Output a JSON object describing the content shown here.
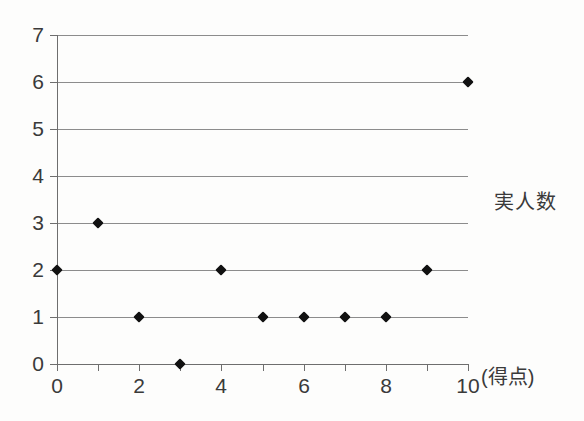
{
  "chart_data": {
    "type": "scatter",
    "title": "",
    "xlabel": "(得点)",
    "ylabel": "実人数",
    "x": [
      0,
      1,
      2,
      3,
      4,
      5,
      6,
      7,
      8,
      9,
      10
    ],
    "values": [
      2,
      3,
      1,
      0,
      2,
      1,
      1,
      1,
      1,
      2,
      6
    ],
    "points": [
      {
        "x": 0,
        "y": 2
      },
      {
        "x": 1,
        "y": 3
      },
      {
        "x": 2,
        "y": 1
      },
      {
        "x": 3,
        "y": 0
      },
      {
        "x": 4,
        "y": 2
      },
      {
        "x": 5,
        "y": 1
      },
      {
        "x": 6,
        "y": 1
      },
      {
        "x": 7,
        "y": 1
      },
      {
        "x": 8,
        "y": 1
      },
      {
        "x": 9,
        "y": 2
      },
      {
        "x": 10,
        "y": 6
      }
    ],
    "xlim": [
      0,
      10
    ],
    "ylim": [
      0,
      7
    ],
    "xticks": [
      0,
      1,
      2,
      3,
      4,
      5,
      6,
      7,
      8,
      9,
      10
    ],
    "xtick_labels": [
      "0",
      "",
      "2",
      "",
      "4",
      "",
      "6",
      "",
      "8",
      "",
      "10"
    ],
    "yticks": [
      0,
      1,
      2,
      3,
      4,
      5,
      6,
      7
    ],
    "ytick_labels": [
      "0",
      "1",
      "2",
      "3",
      "4",
      "5",
      "6",
      "7"
    ],
    "grid": "horizontal",
    "legend": "none",
    "marker": "diamond",
    "marker_color": "#111111",
    "gridline_color": "#8c8c8c",
    "axis_color": "#6e6e6e",
    "background_color": "#fdfdfc"
  },
  "axis_titles": {
    "y": "実人数",
    "x": "(得点)"
  }
}
